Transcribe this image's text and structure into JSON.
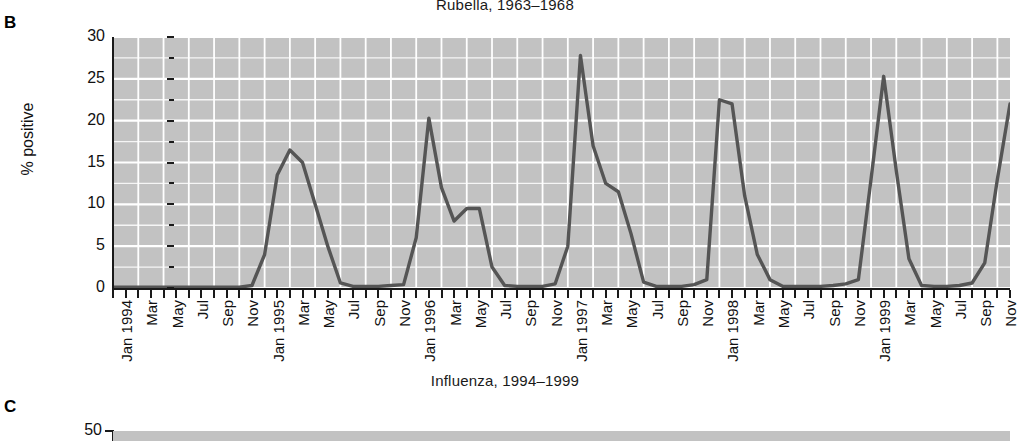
{
  "panels": {
    "b": {
      "letter": "B",
      "title": "Rubella, 1963–1968"
    },
    "c": {
      "letter": "C",
      "title": "Influenza, 1994–1999"
    }
  },
  "colors": {
    "plot_background": "#c2c2c2",
    "gridline": "#ffffff",
    "data_line": "#555555",
    "axis": "#1a1a1a",
    "text": "#111111"
  },
  "chart_data": {
    "type": "line",
    "title": "Rubella, 1963–1968",
    "xlabel": "",
    "ylabel": "% positive",
    "ylim": [
      0,
      30
    ],
    "yticks": [
      0,
      5,
      10,
      15,
      20,
      25,
      30
    ],
    "ytick_labels": [
      "0",
      "5",
      "10",
      "15",
      "20",
      "25",
      "30"
    ],
    "yminor_step": 2.5,
    "grid": true,
    "legend": "none",
    "xlim_labels": [
      "Jan 1994",
      "Nov 1999"
    ],
    "xtick_labels": [
      "Jan 1994",
      "Mar",
      "May",
      "Jul",
      "Sep",
      "Nov",
      "Jan 1995",
      "Mar",
      "May",
      "Jul",
      "Sep",
      "Nov",
      "Jan 1996",
      "Mar",
      "May",
      "Jul",
      "Sep",
      "Nov",
      "Jan 1997",
      "Mar",
      "May",
      "Jul",
      "Sep",
      "Nov",
      "Jan 1998",
      "Mar",
      "May",
      "Jul",
      "Sep",
      "Nov",
      "Jan 1999",
      "Mar",
      "May",
      "Jul",
      "Sep",
      "Nov"
    ],
    "xtick_years": [
      "1994",
      "1995",
      "1996",
      "1997",
      "1998",
      "1999"
    ],
    "x": [
      "Jan 1994",
      "Feb 1994",
      "Mar 1994",
      "Apr 1994",
      "May 1994",
      "Jun 1994",
      "Jul 1994",
      "Aug 1994",
      "Sep 1994",
      "Oct 1994",
      "Nov 1994",
      "Dec 1994",
      "Jan 1995",
      "Feb 1995",
      "Mar 1995",
      "Apr 1995",
      "May 1995",
      "Jun 1995",
      "Jul 1995",
      "Aug 1995",
      "Sep 1995",
      "Oct 1995",
      "Nov 1995",
      "Dec 1995",
      "Jan 1996",
      "Feb 1996",
      "Mar 1996",
      "Apr 1996",
      "May 1996",
      "Jun 1996",
      "Jul 1996",
      "Aug 1996",
      "Sep 1996",
      "Oct 1996",
      "Nov 1996",
      "Dec 1996",
      "Jan 1997",
      "Feb 1997",
      "Mar 1997",
      "Apr 1997",
      "May 1997",
      "Jun 1997",
      "Jul 1997",
      "Aug 1997",
      "Sep 1997",
      "Oct 1997",
      "Nov 1997",
      "Dec 1997",
      "Jan 1998",
      "Feb 1998",
      "Mar 1998",
      "Apr 1998",
      "May 1998",
      "Jun 1998",
      "Jul 1998",
      "Aug 1998",
      "Sep 1998",
      "Oct 1998",
      "Nov 1998",
      "Dec 1998",
      "Jan 1999",
      "Feb 1999",
      "Mar 1999",
      "Apr 1999",
      "May 1999",
      "Jun 1999",
      "Jul 1999",
      "Aug 1999",
      "Sep 1999",
      "Oct 1999",
      "Nov 1999",
      "Dec 1999"
    ],
    "values": [
      0.1,
      0.1,
      0.1,
      0.1,
      0.1,
      0.1,
      0.1,
      0.1,
      0.1,
      0.1,
      0.1,
      0.3,
      4.0,
      13.5,
      16.5,
      15.0,
      10.0,
      5.0,
      0.6,
      0.2,
      0.2,
      0.2,
      0.3,
      0.4,
      6.0,
      20.3,
      12.0,
      8.0,
      9.5,
      9.5,
      2.5,
      0.3,
      0.2,
      0.2,
      0.2,
      0.5,
      5.0,
      27.8,
      17.0,
      12.5,
      11.5,
      6.5,
      0.7,
      0.2,
      0.2,
      0.2,
      0.4,
      1.0,
      22.5,
      22.0,
      11.0,
      4.0,
      1.0,
      0.2,
      0.2,
      0.2,
      0.2,
      0.3,
      0.5,
      1.0,
      13.0,
      25.3,
      14.0,
      3.5,
      0.3,
      0.2,
      0.2,
      0.3,
      0.6,
      3.0,
      13.0,
      22.0
    ],
    "peaks": [
      {
        "label": "Mar 1995",
        "value": 16.5
      },
      {
        "label": "Feb 1996",
        "value": 20.3
      },
      {
        "label": "Feb 1997",
        "value": 27.8
      },
      {
        "label": "Jan 1998",
        "value": 22.5
      },
      {
        "label": "Feb 1999",
        "value": 25.3
      }
    ]
  },
  "panel_c_axis": {
    "ytick_label": "50"
  }
}
